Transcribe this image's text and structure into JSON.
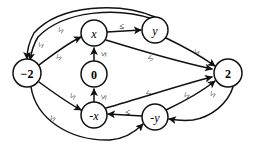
{
  "diagram": {
    "background_color": "#ffffff",
    "stroke_color": "#111111",
    "nodes": [
      {
        "id": "minus2",
        "label": "−2",
        "style": "numeric",
        "cx": 27,
        "cy": 73,
        "r": 14
      },
      {
        "id": "x",
        "label": "x",
        "style": "variable",
        "cx": 94,
        "cy": 33,
        "r": 13
      },
      {
        "id": "zero",
        "label": "0",
        "style": "numeric",
        "cx": 94,
        "cy": 74,
        "r": 13
      },
      {
        "id": "negx",
        "label": "-x",
        "style": "variable",
        "cx": 94,
        "cy": 115,
        "r": 13
      },
      {
        "id": "y",
        "label": "y",
        "style": "variable",
        "cx": 155,
        "cy": 30,
        "r": 13
      },
      {
        "id": "negy",
        "label": "-y",
        "style": "variable",
        "cx": 155,
        "cy": 117,
        "r": 13
      },
      {
        "id": "two",
        "label": "2",
        "style": "numeric",
        "cx": 228,
        "cy": 73,
        "r": 14
      }
    ],
    "edge_label": "≤",
    "edges": [
      {
        "id": "e-y-to-minus2-outer",
        "from": "y",
        "to": "minus2",
        "label": "≤"
      },
      {
        "id": "e-y-to-minus2-inner",
        "from": "y",
        "to": "minus2",
        "label": "≤"
      },
      {
        "id": "e-minus2-to-x",
        "from": "minus2",
        "to": "x",
        "label": "≤"
      },
      {
        "id": "e-x-to-y",
        "from": "x",
        "to": "y",
        "label": "≤"
      },
      {
        "id": "e-zero-to-x",
        "from": "zero",
        "to": "x",
        "label": "≤"
      },
      {
        "id": "e-negx-to-zero",
        "from": "negx",
        "to": "zero",
        "label": "≤"
      },
      {
        "id": "e-x-to-two",
        "from": "x",
        "to": "two",
        "label": "≤"
      },
      {
        "id": "e-y-to-two",
        "from": "y",
        "to": "two",
        "label": "≤"
      },
      {
        "id": "e-minus2-to-negx",
        "from": "minus2",
        "to": "negx",
        "label": "≤"
      },
      {
        "id": "e-minus2-to-negy",
        "from": "minus2",
        "to": "negy",
        "label": "≤"
      },
      {
        "id": "e-negy-to-negx",
        "from": "negy",
        "to": "negx",
        "label": "≤"
      },
      {
        "id": "e-negx-to-two",
        "from": "negx",
        "to": "two",
        "label": "≤"
      },
      {
        "id": "e-negy-to-two",
        "from": "negy",
        "to": "two",
        "label": "≤"
      },
      {
        "id": "e-two-to-negy",
        "from": "two",
        "to": "negy",
        "label": "≤"
      }
    ],
    "edge_labels": [
      {
        "id": "lbl-1",
        "text": "≤",
        "x": 40,
        "y": 45,
        "rot": -62
      },
      {
        "id": "lbl-2",
        "text": "≤",
        "x": 60,
        "y": 30,
        "rot": -55
      },
      {
        "id": "lbl-3",
        "text": "≤",
        "x": 58,
        "y": 57,
        "rot": -50
      },
      {
        "id": "lbl-4",
        "text": "≤",
        "x": 122,
        "y": 26,
        "rot": 0
      },
      {
        "id": "lbl-5",
        "text": "≤",
        "x": 103,
        "y": 54,
        "rot": -80
      },
      {
        "id": "lbl-6",
        "text": "≤",
        "x": 103,
        "y": 97,
        "rot": -80
      },
      {
        "id": "lbl-7",
        "text": "≤",
        "x": 150,
        "y": 58,
        "rot": -28
      },
      {
        "id": "lbl-8",
        "text": "≤",
        "x": 196,
        "y": 52,
        "rot": -60
      },
      {
        "id": "lbl-9",
        "text": "≤",
        "x": 72,
        "y": 96,
        "rot": -55
      },
      {
        "id": "lbl-10",
        "text": "≤",
        "x": 52,
        "y": 118,
        "rot": -55
      },
      {
        "id": "lbl-11",
        "text": "≤",
        "x": 128,
        "y": 112,
        "rot": 0
      },
      {
        "id": "lbl-12",
        "text": "≤",
        "x": 148,
        "y": 93,
        "rot": -30
      },
      {
        "id": "lbl-13",
        "text": "≤",
        "x": 186,
        "y": 95,
        "rot": -52
      },
      {
        "id": "lbl-14",
        "text": "≤",
        "x": 212,
        "y": 94,
        "rot": -55
      }
    ]
  }
}
